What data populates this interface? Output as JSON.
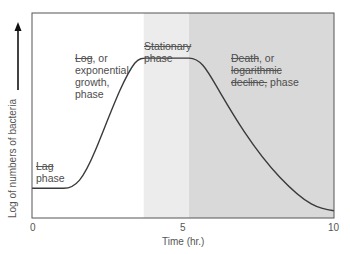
{
  "chart_data": {
    "type": "line",
    "title": "",
    "xlabel": "Time (hr.)",
    "ylabel": "Log of numbers of bacteria",
    "xlim": [
      0,
      10
    ],
    "xticks": [
      0,
      5,
      10
    ],
    "ylim": [
      0,
      1
    ],
    "grid": false,
    "legend": null,
    "series": [
      {
        "name": "Bacterial growth curve",
        "x": [
          0,
          1,
          1.5,
          2,
          2.5,
          3,
          3.5,
          3.8,
          5.2,
          5.7,
          6.5,
          7.5,
          8.5,
          10
        ],
        "y": [
          0.15,
          0.15,
          0.19,
          0.31,
          0.48,
          0.65,
          0.8,
          0.74,
          0.74,
          0.66,
          0.5,
          0.34,
          0.2,
          0.03
        ]
      }
    ],
    "regions": [
      {
        "name": "Lag phase",
        "x_start": 0,
        "x_end": 1
      },
      {
        "name": "Log, or exponential growth, phase",
        "x_start": 1,
        "x_end": 3.7
      },
      {
        "name": "Stationary phase",
        "x_start": 3.7,
        "x_end": 5.2,
        "shade": "#ececec"
      },
      {
        "name": "Death, or logarithmic decline, phase",
        "x_start": 5.2,
        "x_end": 10,
        "shade": "#d9d9d9"
      }
    ],
    "annotations": [
      {
        "text": "Lag phase",
        "x": 0.1,
        "y": 0.22
      },
      {
        "text": "Log, or exponential growth, phase",
        "x": 1.3,
        "y": 0.78
      },
      {
        "text": "Stationary phase",
        "x": 3.8,
        "y": 0.93
      },
      {
        "text": "Death, or logarithmic decline, phase",
        "x": 5.6,
        "y": 0.78
      }
    ]
  },
  "labels": {
    "lag": [
      "Lag",
      "phase"
    ],
    "log": [
      "Log",
      ", or",
      "exponential",
      "growth,",
      "phase"
    ],
    "stationary": [
      "Stationary",
      "phase"
    ],
    "death": [
      "Death",
      ", or",
      "logarithmic",
      "decline,",
      " phase"
    ]
  },
  "colors": {
    "curve": "#3a3a3a",
    "frame": "#555555",
    "stationary_shade": "#ececec",
    "death_shade": "#dadada"
  }
}
